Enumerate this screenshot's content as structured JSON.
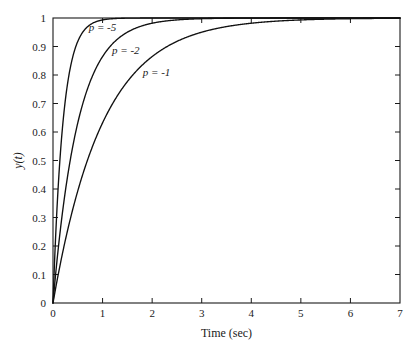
{
  "chart_data": {
    "type": "line",
    "title": "",
    "subtitle": "",
    "xlabel": "Time (sec)",
    "ylabel": "y(t)",
    "xlim": [
      0,
      7
    ],
    "ylim": [
      0,
      1
    ],
    "grid": false,
    "legend_position": "inline-annotations",
    "xticks": [
      0,
      1,
      2,
      3,
      4,
      5,
      6,
      7
    ],
    "xticklabels": [
      "0",
      "1",
      "2",
      "3",
      "4",
      "5",
      "6",
      "7"
    ],
    "yticks": [
      0,
      0.1,
      0.2,
      0.3,
      0.4,
      0.5,
      0.6,
      0.7,
      0.8,
      0.9,
      1
    ],
    "yticklabels": [
      "0",
      "0.1",
      "0.2",
      "0.3",
      "0.4",
      "0.5",
      "0.6",
      "0.7",
      "0.8",
      "0.9",
      "1"
    ],
    "function": "y(t) = 1 - exp(p*t)",
    "series": [
      {
        "name": "p = -5",
        "p": -5,
        "label": "p = -5",
        "color": "#111111",
        "x": [
          0,
          0.1,
          0.2,
          0.3,
          0.4,
          0.5,
          0.6,
          0.7,
          0.8,
          0.9,
          1.0,
          1.2,
          1.4,
          1.6,
          1.8,
          2.0,
          2.5,
          3.0,
          3.5,
          4.0,
          5.0,
          6.0,
          7.0
        ],
        "values": [
          0,
          0.393,
          0.632,
          0.777,
          0.865,
          0.918,
          0.95,
          0.97,
          0.982,
          0.989,
          0.993,
          0.998,
          0.999,
          1.0,
          1.0,
          1.0,
          1.0,
          1.0,
          1.0,
          1.0,
          1.0,
          1.0,
          1.0
        ]
      },
      {
        "name": "p = -2",
        "p": -2,
        "label": "p = -2",
        "color": "#111111",
        "x": [
          0,
          0.1,
          0.2,
          0.3,
          0.4,
          0.5,
          0.6,
          0.8,
          1.0,
          1.2,
          1.4,
          1.6,
          1.8,
          2.0,
          2.5,
          3.0,
          3.5,
          4.0,
          5.0,
          6.0,
          7.0
        ],
        "values": [
          0,
          0.181,
          0.33,
          0.451,
          0.551,
          0.632,
          0.699,
          0.798,
          0.865,
          0.909,
          0.939,
          0.959,
          0.973,
          0.982,
          0.993,
          0.998,
          0.999,
          1.0,
          1.0,
          1.0,
          1.0
        ]
      },
      {
        "name": "p = -1",
        "p": -1,
        "label": "p = -1",
        "color": "#111111",
        "x": [
          0,
          0.2,
          0.4,
          0.6,
          0.8,
          1.0,
          1.2,
          1.5,
          2.0,
          2.5,
          3.0,
          3.5,
          4.0,
          4.5,
          5.0,
          5.5,
          6.0,
          6.5,
          7.0
        ],
        "values": [
          0,
          0.181,
          0.33,
          0.451,
          0.551,
          0.632,
          0.699,
          0.777,
          0.865,
          0.918,
          0.95,
          0.97,
          0.982,
          0.989,
          0.993,
          0.996,
          0.998,
          0.998,
          0.999
        ]
      }
    ],
    "annotations": [
      {
        "text": "p = -5",
        "x": 0.72,
        "y": 0.955
      },
      {
        "text": "p = -2",
        "x": 1.19,
        "y": 0.875
      },
      {
        "text": "p = -1",
        "x": 1.81,
        "y": 0.795
      }
    ]
  }
}
